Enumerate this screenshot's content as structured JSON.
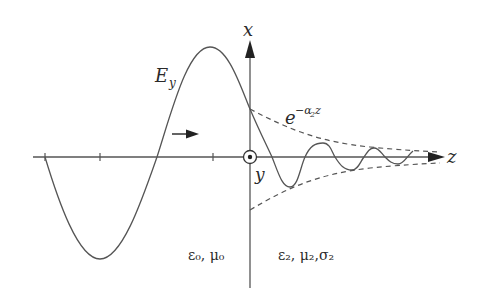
{
  "diagram": {
    "title": "",
    "labels": {
      "axis_x": "x",
      "axis_z": "z",
      "axis_y": "y",
      "field": "E",
      "field_sub": "y",
      "envelope_base": "e",
      "envelope_exp": "−α",
      "envelope_exp_sub": "2",
      "envelope_exp_tail": "z",
      "medium_left": "ε₀, μ₀",
      "medium_right": "ε₂, μ₂,σ₂"
    },
    "colors": {
      "axis": "#555555",
      "curve": "#555555",
      "envelope": "#555555",
      "text": "#2a2a2a"
    },
    "elements": [
      {
        "id": "incident-wave",
        "kind": "sinusoid",
        "region": "z<0"
      },
      {
        "id": "damped-wave",
        "kind": "damped-sinusoid",
        "region": "z>0"
      },
      {
        "id": "upper-envelope",
        "kind": "dashed-exponential",
        "formula": "e^{-α2 z}"
      },
      {
        "id": "lower-envelope",
        "kind": "dashed-exponential",
        "formula": "-e^{-α2 z}"
      },
      {
        "id": "propagation-arrow",
        "direction": "+z"
      },
      {
        "id": "y-axis-marker",
        "kind": "out-of-page dot-in-circle"
      }
    ]
  }
}
